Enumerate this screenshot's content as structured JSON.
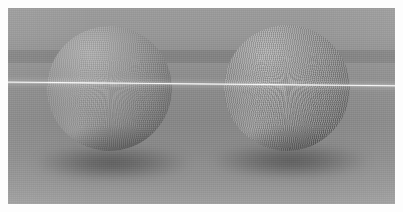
{
  "scene": {
    "title": "Two shaded spheres on a ground plane",
    "render_mode": "grayscale",
    "frame": {
      "width": 403,
      "height": 212,
      "matte_border_px": 8,
      "matte_color": "#ffffff"
    },
    "background": {
      "sky_color": "#969696",
      "horizon_band_color": "#828282",
      "ground_color": "#8a8a8a",
      "ground_far_color": "#9d9d9d",
      "horizon_band_top_px": 50,
      "horizon_band_bottom_px": 63
    },
    "highlight_streak": {
      "name": "horizontal light streak",
      "color": "#ffffff",
      "left_y_px": 83,
      "right_y_px": 87,
      "thickness_px": 2
    },
    "objects": [
      {
        "id": "sphere-left",
        "label": "Left sphere",
        "shape": "sphere",
        "center_x": 110,
        "center_y": 100,
        "radius": 62,
        "surface": "matte wireframe mesh",
        "highlight_color": "#b2b2b2",
        "shadow_color": "#545454",
        "light_direction": "upper-left"
      },
      {
        "id": "sphere-right",
        "label": "Right sphere",
        "shape": "sphere",
        "center_x": 290,
        "center_y": 98,
        "radius": 62,
        "surface": "matte wireframe mesh, pronounced ribbing",
        "highlight_color": "#b2b2b2",
        "shadow_color": "#545454",
        "light_direction": "upper-left"
      }
    ],
    "shadows": [
      {
        "id": "shadow-left",
        "label": "Contact shadow under left sphere",
        "color": "#3a3a3a"
      },
      {
        "id": "shadow-right",
        "label": "Contact shadow under right sphere",
        "color": "#3a3a3a"
      }
    ]
  }
}
